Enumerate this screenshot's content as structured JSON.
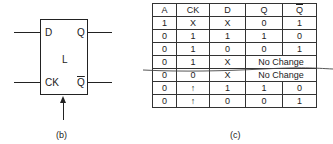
{
  "flipflop": {
    "inputs": {
      "d": "D",
      "ck": "CK"
    },
    "outputs": {
      "q": "Q",
      "qbar": "Q"
    },
    "center_label": "L",
    "caption": "(b)"
  },
  "truth_table": {
    "headers": [
      "A",
      "CK",
      "D",
      "Q",
      "Q"
    ],
    "rows": [
      [
        "1",
        "X",
        "X",
        "0",
        "1"
      ],
      [
        "0",
        "1",
        "1",
        "1",
        "0"
      ],
      [
        "0",
        "1",
        "0",
        "0",
        "1"
      ],
      [
        "0",
        "1",
        "X",
        "No Change"
      ],
      [
        "0",
        "0",
        "X",
        "No Change"
      ],
      [
        "0",
        "↑",
        "1",
        "1",
        "0"
      ],
      [
        "0",
        "↑",
        "0",
        "0",
        "1"
      ]
    ],
    "caption": "(c)"
  }
}
